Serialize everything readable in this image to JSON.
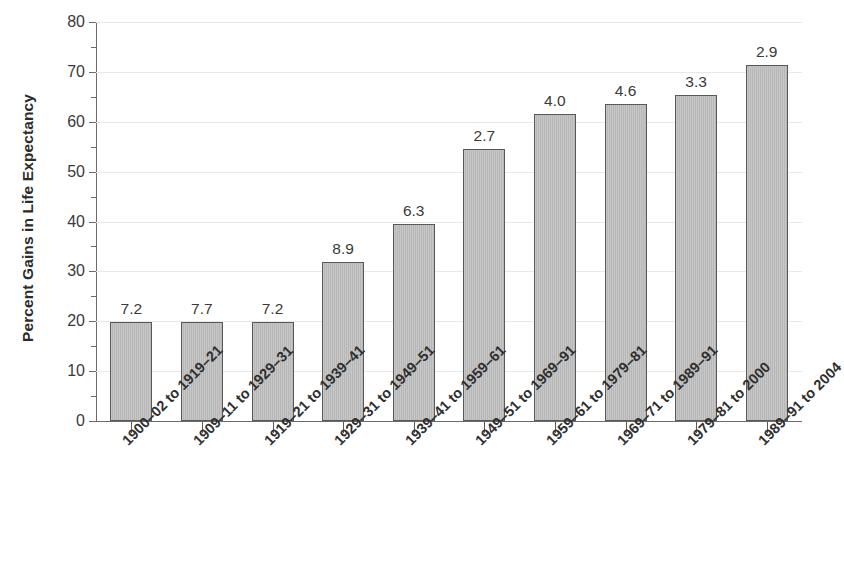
{
  "chart_data": {
    "type": "bar",
    "title": "",
    "xlabel": "",
    "ylabel": "Percent Gains in Life Expectancy",
    "ylim": [
      0,
      80
    ],
    "ytick_step": 10,
    "grid": true,
    "legend": "none",
    "categories": [
      "1900–02 to 1919–21",
      "1909–11 to 1929–31",
      "1919–21 to 1939–41",
      "1929–31 to 1949–51",
      "1939–41 to 1959–61",
      "1949–51 to 1969–91",
      "1959–61 to 1979–81",
      "1969–71 to 1989–91",
      "1979–81 to 2000",
      "1989–91 to 2004"
    ],
    "values": [
      19.9,
      19.9,
      19.8,
      31.8,
      39.6,
      54.5,
      61.5,
      63.5,
      65.4,
      71.3
    ],
    "bar_labels": [
      "7.2",
      "7.7",
      "7.2",
      "8.9",
      "6.3",
      "2.7",
      "4.0",
      "4.6",
      "3.3",
      "2.9"
    ],
    "ytick_labels": [
      "0",
      "10",
      "20",
      "30",
      "40",
      "50",
      "60",
      "70",
      "80"
    ],
    "ytick_values": [
      0,
      10,
      20,
      30,
      40,
      50,
      60,
      70,
      80
    ],
    "colors": {
      "bar_fill": "#b7b7b7",
      "bar_border": "#585858",
      "gridline": "#e8e8e8",
      "axis": "#6b6b6b",
      "text": "#333333",
      "background": "#ffffff"
    }
  }
}
